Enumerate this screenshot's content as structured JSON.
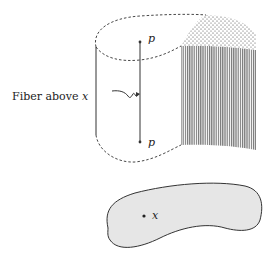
{
  "diagram": {
    "type": "fiber-bundle-illustration",
    "labels": {
      "fiber_caption_prefix": "Fiber above ",
      "fiber_caption_var": "x",
      "point_top": "p",
      "point_bottom": "p",
      "base_point": "x"
    },
    "colors": {
      "stroke": "#333333",
      "hatch": "#777777",
      "base_fill": "#e6e6e6",
      "text": "#222222"
    }
  }
}
